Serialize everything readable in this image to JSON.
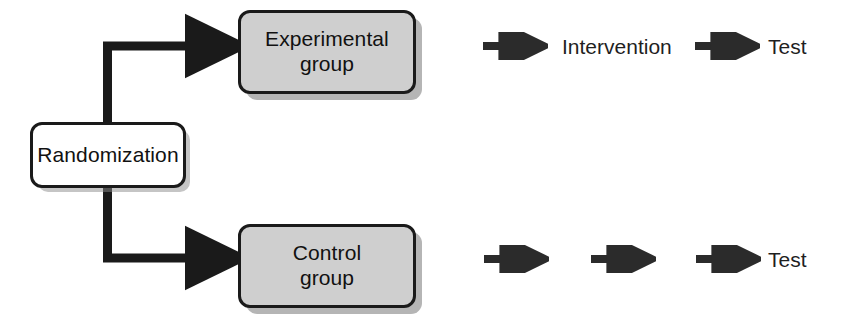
{
  "diagram": {
    "type": "randomized-controlled-trial-flow",
    "colors": {
      "stroke": "#1a1a1a",
      "shaded_fill": "#cfcfcf",
      "plain_fill": "#ffffff",
      "text": "#111111",
      "shadow": "#9a9a9a",
      "background": "#ffffff"
    },
    "nodes": [
      {
        "id": "randomization",
        "label": "Randomization",
        "style": "plain",
        "x": 30,
        "y": 122,
        "w": 156,
        "h": 66
      },
      {
        "id": "experimental-group",
        "label": "Experimental\ngroup",
        "style": "shaded",
        "x": 238,
        "y": 10,
        "w": 178,
        "h": 84
      },
      {
        "id": "control-group",
        "label": "Control\ngroup",
        "style": "shaded",
        "x": 238,
        "y": 224,
        "w": 178,
        "h": 84
      }
    ],
    "connectors": [
      {
        "id": "randomization-to-experimental",
        "from": "randomization",
        "to": "experimental-group"
      },
      {
        "id": "randomization-to-control",
        "from": "randomization",
        "to": "control-group"
      }
    ],
    "rows": [
      {
        "id": "experimental-row",
        "group": "experimental-group",
        "steps": [
          {
            "kind": "arrow",
            "id": "exp-arrow-1",
            "label": ""
          },
          {
            "kind": "text",
            "id": "exp-step-intervention",
            "label": "Intervention"
          },
          {
            "kind": "arrow",
            "id": "exp-arrow-2",
            "label": ""
          },
          {
            "kind": "text",
            "id": "exp-step-test",
            "label": "Test"
          }
        ]
      },
      {
        "id": "control-row",
        "group": "control-group",
        "steps": [
          {
            "kind": "arrow",
            "id": "ctl-arrow-1",
            "label": ""
          },
          {
            "kind": "arrow",
            "id": "ctl-arrow-2",
            "label": ""
          },
          {
            "kind": "arrow",
            "id": "ctl-arrow-3",
            "label": ""
          },
          {
            "kind": "text",
            "id": "ctl-step-test",
            "label": "Test"
          }
        ]
      }
    ]
  }
}
